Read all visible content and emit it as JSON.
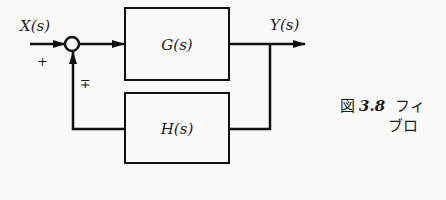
{
  "diagram": {
    "type": "feedback-control-block-diagram",
    "input_label": "X(s)",
    "output_label": "Y(s)",
    "forward_block": "G(s)",
    "feedback_block": "H(s)",
    "input_sign": "+",
    "feedback_sign": "∓",
    "line_color": "#111111"
  },
  "caption": {
    "figure_prefix": "図",
    "figure_number": "3.8",
    "line1_text": "フィ",
    "line2_text": "ブロ"
  }
}
